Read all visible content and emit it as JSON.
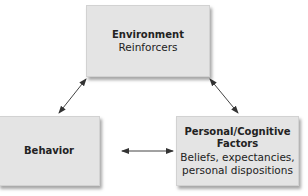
{
  "diagram": {
    "type": "triadic reciprocal causation",
    "nodes": [
      {
        "id": "environment",
        "title": "Environment",
        "subtitle_lines": [
          "Reinforcers"
        ]
      },
      {
        "id": "behavior",
        "title": "Behavior",
        "subtitle_lines": []
      },
      {
        "id": "personal",
        "title_lines": [
          "Personal/Cognitive",
          "Factors"
        ],
        "subtitle_lines": [
          "Beliefs, expectancies,",
          "personal dispositions"
        ]
      }
    ],
    "edges": [
      {
        "from": "environment",
        "to": "behavior",
        "bidirectional": true
      },
      {
        "from": "environment",
        "to": "personal",
        "bidirectional": true
      },
      {
        "from": "behavior",
        "to": "personal",
        "bidirectional": true
      }
    ]
  },
  "colors": {
    "box_fill": "#e4e4e4",
    "box_border": "#d2d2d2",
    "arrow": "#333333",
    "text": "#222222"
  }
}
